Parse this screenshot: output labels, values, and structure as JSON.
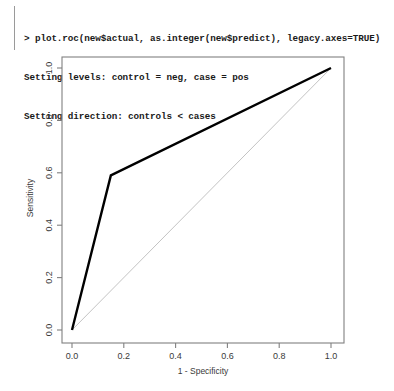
{
  "console": {
    "lines": [
      "> plot.roc(new$actual, as.integer(new$predict), legacy.axes=TRUE)",
      "Setting levels: control = neg, case = pos",
      "Setting direction: controls < cases"
    ]
  },
  "colors": {
    "roc_curve": "#000000",
    "reference_line": "#b4b4b4",
    "axis": "#808080",
    "text": "#3a3a3a",
    "background": "#ffffff"
  },
  "chart_data": {
    "type": "line",
    "title": "",
    "xlabel": "1 - Specificity",
    "ylabel": "Sensitivity",
    "xlim": [
      0.0,
      1.0
    ],
    "ylim": [
      0.0,
      1.0
    ],
    "grid": false,
    "legend": null,
    "xticks": [
      0.0,
      0.2,
      0.4,
      0.6,
      0.8,
      1.0
    ],
    "xticklabels": [
      "0.0",
      "0.2",
      "0.4",
      "0.6",
      "0.8",
      "1.0"
    ],
    "yticks": [
      0.0,
      0.2,
      0.4,
      0.6,
      0.8,
      1.0
    ],
    "yticklabels": [
      "0.0",
      "0.2",
      "0.4",
      "0.6",
      "0.8",
      "1.0"
    ],
    "series": [
      {
        "name": "ROC curve",
        "color": "#000000",
        "linewidth": 2.4,
        "x": [
          0.0,
          0.15,
          1.0
        ],
        "y": [
          0.0,
          0.59,
          1.0
        ]
      },
      {
        "name": "Chance reference line",
        "color": "#b4b4b4",
        "linewidth": 0.8,
        "x": [
          0.0,
          1.0
        ],
        "y": [
          0.0,
          1.0
        ]
      }
    ]
  }
}
